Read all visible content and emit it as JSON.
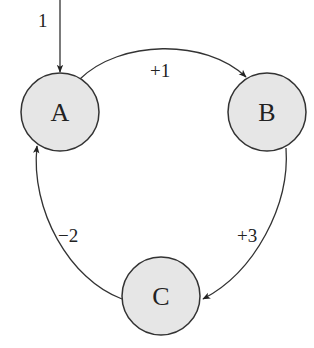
{
  "diagram": {
    "type": "state-transition-graph",
    "nodes": [
      {
        "id": "A",
        "label": "A"
      },
      {
        "id": "B",
        "label": "B"
      },
      {
        "id": "C",
        "label": "C"
      }
    ],
    "initial": {
      "target": "A",
      "label": "1"
    },
    "edges": [
      {
        "from": "A",
        "to": "B",
        "label": "+1"
      },
      {
        "from": "B",
        "to": "C",
        "label": "+3"
      },
      {
        "from": "C",
        "to": "A",
        "label": "−2"
      }
    ],
    "colors": {
      "node_fill": "#e6e6e6",
      "stroke": "#333333",
      "text": "#222222"
    }
  }
}
